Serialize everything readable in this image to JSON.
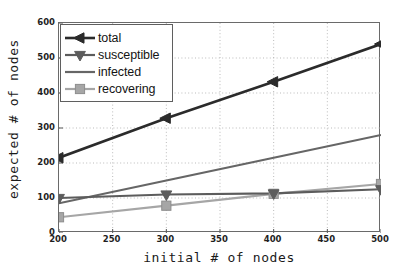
{
  "chart_data": {
    "type": "line",
    "title": "",
    "xlabel": "initial # of nodes",
    "ylabel": "expected # of nodes",
    "x": [
      200,
      300,
      400,
      500
    ],
    "xlim": [
      200,
      500
    ],
    "ylim": [
      0,
      600
    ],
    "xticks": [
      "200",
      "250",
      "300",
      "350",
      "400",
      "450",
      "500"
    ],
    "xtick_values": [
      200,
      250,
      300,
      350,
      400,
      450,
      500
    ],
    "yticks": [
      "0",
      "100",
      "200",
      "300",
      "400",
      "500",
      "600"
    ],
    "ytick_values": [
      0,
      100,
      200,
      300,
      400,
      500,
      600
    ],
    "grid": true,
    "grid_style": "dotted",
    "legend_position": "top-left",
    "series": [
      {
        "name": "total",
        "values": [
          215,
          328,
          432,
          540
        ],
        "color": "#2b2b2b",
        "marker": "triangle-left",
        "line_width": 2.6
      },
      {
        "name": "susceptible",
        "values": [
          100,
          110,
          113,
          125
        ],
        "color": "#5c5c5c",
        "marker": "triangle-down",
        "line_width": 2.2
      },
      {
        "name": "infected",
        "values": [
          85,
          150,
          215,
          280
        ],
        "color": "#666666",
        "marker": "none",
        "line_width": 2.2
      },
      {
        "name": "recovering",
        "values": [
          45,
          78,
          112,
          140
        ],
        "color": "#a6a6a6",
        "marker": "square",
        "line_width": 2.2
      }
    ]
  },
  "legend": {
    "items": [
      {
        "label": "total"
      },
      {
        "label": "susceptible"
      },
      {
        "label": "infected"
      },
      {
        "label": "recovering"
      }
    ]
  }
}
